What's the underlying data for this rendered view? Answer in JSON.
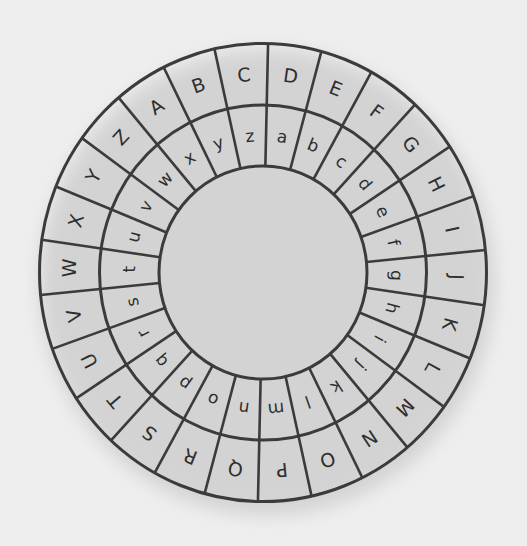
{
  "wheel": {
    "center": {
      "x": 263,
      "y": 272.5
    },
    "scale_y": 1.025,
    "radii": {
      "outer": 223.5,
      "middle": 163.5,
      "inner": 104
    },
    "label_radii": {
      "outer": 194,
      "inner": 134
    },
    "start_angle_deg": 1.3,
    "segment_count": 26,
    "colors": {
      "background": "#eeeeee",
      "disc": "#ffffff",
      "lines": "#3b3b3b",
      "text": "#2e2e2e",
      "shadow": "#b8b8b8"
    },
    "outer_ring": {
      "letters": [
        "D",
        "E",
        "F",
        "G",
        "H",
        "I",
        "J",
        "K",
        "L",
        "M",
        "N",
        "O",
        "P",
        "Q",
        "R",
        "S",
        "T",
        "U",
        "V",
        "W",
        "X",
        "Y",
        "Z",
        "A",
        "B",
        "C"
      ]
    },
    "inner_ring": {
      "letters": [
        "a",
        "b",
        "c",
        "d",
        "e",
        "f",
        "g",
        "h",
        "i",
        "j",
        "k",
        "l",
        "m",
        "n",
        "o",
        "p",
        "q",
        "r",
        "s",
        "t",
        "u",
        "v",
        "w",
        "x",
        "y",
        "z"
      ]
    }
  }
}
